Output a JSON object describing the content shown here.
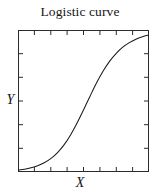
{
  "chart_data": {
    "type": "line",
    "title": "Logistic curve",
    "xlabel": "X",
    "ylabel": "Y",
    "grid": false,
    "legend": "none",
    "xlim": [
      0,
      1
    ],
    "ylim": [
      0,
      1
    ],
    "x_tick_count": 8,
    "y_tick_count": 5,
    "tick_direction": "in",
    "tick_labels_x": [],
    "tick_labels_y": [],
    "curve_color": "#1a1a1a",
    "frame_color": "#2b2b2b",
    "background_color": "#ffffff",
    "series": [
      {
        "name": "logistic",
        "equation": "y = 1 / (1 + exp(-k(x - x0)))",
        "x": [
          0.0,
          0.05,
          0.1,
          0.15,
          0.2,
          0.25,
          0.3,
          0.35,
          0.4,
          0.45,
          0.5,
          0.55,
          0.6,
          0.65,
          0.7,
          0.75,
          0.8,
          0.85,
          0.9,
          0.95,
          1.0
        ],
        "values": [
          0.013,
          0.02,
          0.03,
          0.044,
          0.065,
          0.094,
          0.135,
          0.189,
          0.259,
          0.343,
          0.437,
          0.534,
          0.628,
          0.711,
          0.781,
          0.836,
          0.879,
          0.911,
          0.935,
          0.952,
          0.965
        ]
      }
    ]
  },
  "figure": {
    "title": "Logistic curve",
    "x_axis_label": "X",
    "y_axis_label": "Y"
  }
}
